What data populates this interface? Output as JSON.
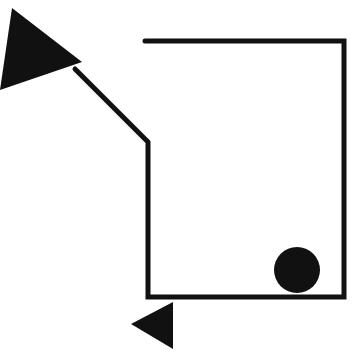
{
  "diagram": {
    "background": "#ffffff",
    "stroke_color": "#111111",
    "fill_color": "#111111",
    "stroke_width": 5,
    "path": {
      "description": "open polyline from top line, around box, up to diagonal",
      "points": "145,41 344,41 344,297 148,297 148,142 75,69"
    },
    "large_arrow": {
      "points": "12,8 82,62 0,90"
    },
    "small_arrow": {
      "points": "131,324 173,302 173,349"
    },
    "ball": {
      "cx": 297,
      "cy": 270,
      "r": 23
    }
  }
}
